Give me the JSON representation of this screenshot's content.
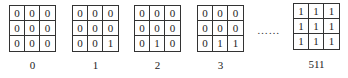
{
  "figure": {
    "ellipsis": "……",
    "patterns": [
      {
        "index_label": "0",
        "cells": [
          [
            "0",
            "0",
            "0"
          ],
          [
            "0",
            "0",
            "0"
          ],
          [
            "0",
            "0",
            "0"
          ]
        ]
      },
      {
        "index_label": "1",
        "cells": [
          [
            "0",
            "0",
            "0"
          ],
          [
            "0",
            "0",
            "0"
          ],
          [
            "0",
            "0",
            "1"
          ]
        ]
      },
      {
        "index_label": "2",
        "cells": [
          [
            "0",
            "0",
            "0"
          ],
          [
            "0",
            "0",
            "0"
          ],
          [
            "0",
            "1",
            "0"
          ]
        ]
      },
      {
        "index_label": "3",
        "cells": [
          [
            "0",
            "0",
            "0"
          ],
          [
            "0",
            "0",
            "0"
          ],
          [
            "0",
            "1",
            "1"
          ]
        ]
      },
      {
        "index_label": "511",
        "cells": [
          [
            "1",
            "1",
            "1"
          ],
          [
            "1",
            "1",
            "1"
          ],
          [
            "1",
            "1",
            "1"
          ]
        ]
      }
    ]
  }
}
